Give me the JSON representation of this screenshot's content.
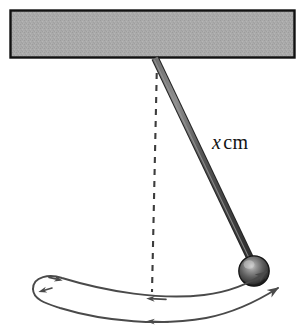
{
  "figure": {
    "background_color": "#ffffff"
  },
  "support_bar": {
    "name": "horizontal support bar",
    "fill_color": "#a9a9a9",
    "border_color": "#111111",
    "x": 10,
    "y": 10,
    "width": 285,
    "height": 48
  },
  "pivot": {
    "name": "pivot point",
    "x": 155,
    "y": 58
  },
  "rod": {
    "name": "pendulum rod",
    "color": "#4a4a4a",
    "highlight_color": "#8e8e8e",
    "thickness": 6,
    "from_x": 155,
    "from_y": 58,
    "to_x": 251,
    "to_y": 260
  },
  "bob": {
    "name": "pendulum bob",
    "center_x": 254,
    "center_y": 271,
    "radius": 15,
    "base_color": "#4d4d4d",
    "highlight_color": "#b9b9b9",
    "shadow_color": "#1d1d1d"
  },
  "vertical_reference": {
    "name": "dashed vertical reference line",
    "style": "dashed",
    "color": "#3c3c3c",
    "x_top": 157,
    "y_top": 60,
    "x_bottom": 152,
    "y_bottom": 292
  },
  "swing_arcs": {
    "name": "swing path arrows",
    "color": "#4a4a4a",
    "arc_count": 2,
    "arrow_count": 5
  },
  "labels": {
    "length": {
      "variable": "x",
      "unit": "cm",
      "full_text": "x cm"
    }
  },
  "colors": {
    "bar_fill": "#a9a9a9",
    "ink": "#131313",
    "rod": "#4a4a4a"
  }
}
